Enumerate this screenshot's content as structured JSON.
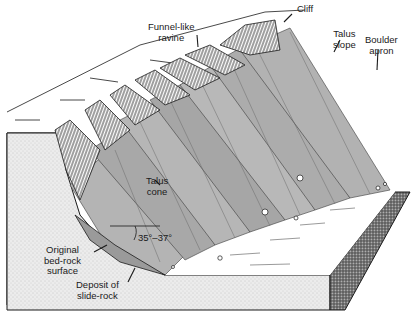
{
  "figure": {
    "labels": {
      "cliff": "Cliff",
      "funnel_ravine": "Funnel-like\nravine",
      "talus_slope": "Talus\nslope",
      "boulder_apron": "Boulder\napron",
      "talus_cone": "Talus\ncone",
      "angle": "35°–37°",
      "bedrock": "Original\nbed-rock\nsurface",
      "slide_rock": "Deposit of\nslide-rock"
    },
    "colors": {
      "ink": "#1a1a1a",
      "talus_fill": "#b8b8b8",
      "talus_dark": "#8a8a8a",
      "block_side": "#e4e4e4",
      "block_front_dark": "#6e6e6e",
      "paper": "#ffffff"
    }
  }
}
